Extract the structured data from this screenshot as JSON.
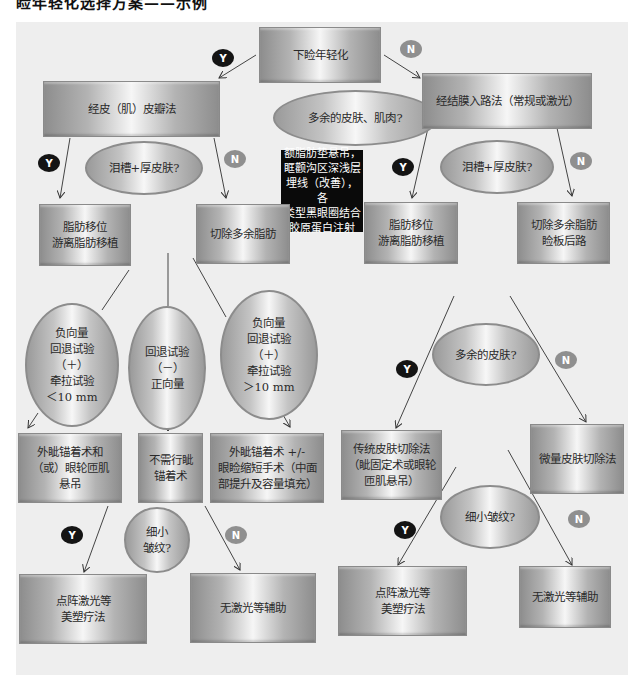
{
  "title_cropped": "睑年轻化选择方案——示例",
  "colors": {
    "panel_bg": "#eeeeee",
    "yes_badge": "#141414",
    "no_badge": "#8f8f8f",
    "note_bg": "#0a0a0a"
  },
  "badges": {
    "yes": "Y",
    "no": "N"
  },
  "nodes": {
    "root": "下睑年轻化",
    "q_excess": "多余的皮肤、肌肉?",
    "transcutaneous": "经皮（肌）皮瓣法",
    "transconjunctival": "经结膜入路法（常规或激光）",
    "q_left_tear": "泪槽+厚皮肤?",
    "q_right_tear": "泪槽+厚皮肤?",
    "note": "额脂肪垫悬吊，\n眶颧沟区深浅层\n埋线（改善），各\n类型黑眼圈结合\n胶原蛋白注射",
    "left_fat_reposition": "脂肪移位\n游离脂肪移植",
    "left_excise_fat": "切除多余脂肪",
    "right_fat_reposition": "脂肪移位\n游离脂肪移植",
    "right_excise_fat": "切除多余脂肪\n睑板后路",
    "oval_neg_lt10": "负向量\n回退试验\n（＋）\n牵拉试验\n＜10 mm",
    "oval_neg_test": "回退试验\n（－）\n正向量",
    "oval_neg_gt10": "负向量\n回退试验\n（＋）\n牵拉试验\n＞10 mm",
    "canthopexy_and": "外眦锚着术和\n（或）眼轮匝肌\n悬吊",
    "no_canthopexy": "不需行眦\n锚着术",
    "canthopexy_plus": "外眦锚着术 +/-\n眼睑缩短手术（中面\n部提升及容量填充）",
    "q_left_wrinkle": "细小\n皱纹?",
    "left_laser": "点阵激光等\n美塑疗法",
    "left_no_laser": "无激光等辅助",
    "q_right_skin": "多余的皮肤?",
    "traditional_excision": "传统皮肤切除法\n（眦固定术或眼轮\n匝肌悬吊）",
    "micro_excision": "微量皮肤切除法",
    "q_right_wrinkle": "细小皱纹?",
    "right_laser": "点阵激光等\n美塑疗法",
    "right_no_laser": "无激光等辅助"
  }
}
